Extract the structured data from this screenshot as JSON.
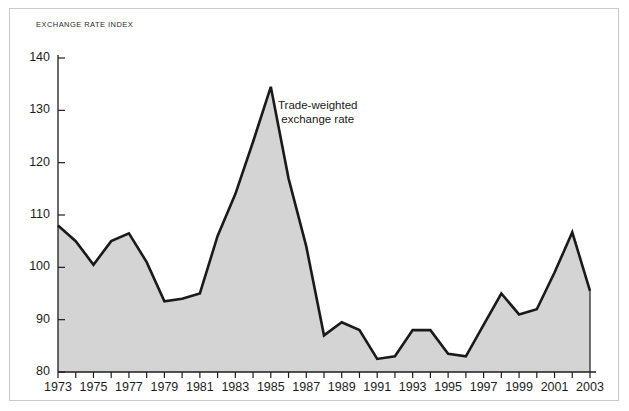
{
  "figure": {
    "axis_title": "EXCHANGE RATE INDEX",
    "annotation": "Trade-weighted\nexchange rate",
    "line_color": "#1a1a1a",
    "fill_color": "#d4d4d4",
    "frame_color": "#c9c9c9",
    "axis_color": "#1d1d1d",
    "background": "#ffffff"
  },
  "chart_data": {
    "type": "area",
    "title": "",
    "subtitle": "",
    "xlabel": "",
    "ylabel": "EXCHANGE RATE INDEX",
    "xlim": [
      1973,
      2003
    ],
    "ylim": [
      80,
      140
    ],
    "ytick_step": 10,
    "xtick_step": 1,
    "xlabel_step": 2,
    "grid": false,
    "legend": "annotation-inline",
    "annotations": [
      {
        "text": "Trade-weighted exchange rate",
        "x": 1986.5,
        "y": 126
      }
    ],
    "ytick_labels": [
      "80",
      "90",
      "100",
      "110",
      "120",
      "130",
      "140"
    ],
    "ytick_values": [
      80,
      90,
      100,
      110,
      120,
      130,
      140
    ],
    "xtick_values": [
      1973,
      1974,
      1975,
      1976,
      1977,
      1978,
      1979,
      1980,
      1981,
      1982,
      1983,
      1984,
      1985,
      1986,
      1987,
      1988,
      1989,
      1990,
      1991,
      1992,
      1993,
      1994,
      1995,
      1996,
      1997,
      1998,
      1999,
      2000,
      2001,
      2002,
      2003
    ],
    "xtick_labels": [
      "1973",
      "",
      "1975",
      "",
      "1977",
      "",
      "1979",
      "",
      "1981",
      "",
      "1983",
      "",
      "1985",
      "",
      "1987",
      "",
      "1989",
      "",
      "1991",
      "",
      "1993",
      "",
      "1995",
      "",
      "1997",
      "",
      "1999",
      "",
      "2001",
      "",
      "2003"
    ],
    "series": [
      {
        "name": "Trade-weighted exchange rate",
        "x": [
          1973,
          1974,
          1975,
          1976,
          1977,
          1978,
          1979,
          1980,
          1981,
          1982,
          1983,
          1984,
          1985,
          1986,
          1987,
          1988,
          1989,
          1990,
          1991,
          1992,
          1993,
          1994,
          1995,
          1996,
          1997,
          1998,
          1999,
          2000,
          2001,
          2002,
          2003
        ],
        "values": [
          108.0,
          105.0,
          100.5,
          105.0,
          106.5,
          101.0,
          93.5,
          94.0,
          95.0,
          106.0,
          114.0,
          124.0,
          134.5,
          117.0,
          104.0,
          87.0,
          89.5,
          88.0,
          82.5,
          83.0,
          88.0,
          88.0,
          83.5,
          83.0,
          89.0,
          95.0,
          91.0,
          92.0,
          99.0,
          106.7,
          95.5
        ]
      }
    ]
  }
}
